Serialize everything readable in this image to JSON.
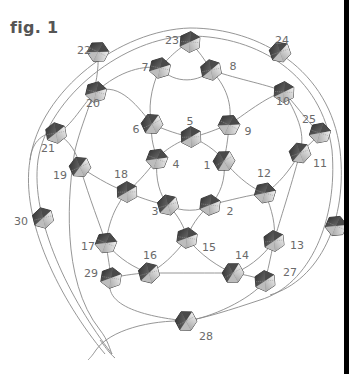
{
  "figure": {
    "title": "fig. 1",
    "colors": {
      "thread": "#8a8a8a",
      "bead_dark": "#3a3a3a",
      "bead_mid": "#7a7a7a",
      "bead_light": "#d8d8d8",
      "label": "#6a6a6a",
      "edge_bar": "#000000"
    }
  },
  "beads": [
    {
      "id": "1",
      "x": 224,
      "y": 161,
      "lx": 207,
      "ly": 165
    },
    {
      "id": "2",
      "x": 210,
      "y": 205,
      "lx": 230,
      "ly": 211
    },
    {
      "id": "3",
      "x": 168,
      "y": 205,
      "lx": 155,
      "ly": 211
    },
    {
      "id": "4",
      "x": 157,
      "y": 159,
      "lx": 176,
      "ly": 164
    },
    {
      "id": "5",
      "x": 191,
      "y": 137,
      "lx": 190,
      "ly": 121
    },
    {
      "id": "6",
      "x": 152,
      "y": 124,
      "lx": 136,
      "ly": 129
    },
    {
      "id": "7",
      "x": 160,
      "y": 68,
      "lx": 145,
      "ly": 67
    },
    {
      "id": "8",
      "x": 211,
      "y": 70,
      "lx": 233,
      "ly": 66
    },
    {
      "id": "9",
      "x": 229,
      "y": 125,
      "lx": 248,
      "ly": 131
    },
    {
      "id": "10",
      "x": 284,
      "y": 92,
      "lx": 283,
      "ly": 101
    },
    {
      "id": "11",
      "x": 300,
      "y": 153,
      "lx": 320,
      "ly": 163
    },
    {
      "id": "12",
      "x": 265,
      "y": 193,
      "lx": 264,
      "ly": 173
    },
    {
      "id": "13",
      "x": 274,
      "y": 241,
      "lx": 297,
      "ly": 245
    },
    {
      "id": "14",
      "x": 233,
      "y": 273,
      "lx": 242,
      "ly": 255
    },
    {
      "id": "15",
      "x": 187,
      "y": 238,
      "lx": 209,
      "ly": 247
    },
    {
      "id": "16",
      "x": 149,
      "y": 273,
      "lx": 150,
      "ly": 255
    },
    {
      "id": "17",
      "x": 106,
      "y": 243,
      "lx": 88,
      "ly": 246
    },
    {
      "id": "18",
      "x": 127,
      "y": 192,
      "lx": 121,
      "ly": 174
    },
    {
      "id": "19",
      "x": 80,
      "y": 167,
      "lx": 60,
      "ly": 175
    },
    {
      "id": "20",
      "x": 96,
      "y": 92,
      "lx": 93,
      "ly": 103
    },
    {
      "id": "21",
      "x": 56,
      "y": 133,
      "lx": 48,
      "ly": 148
    },
    {
      "id": "22",
      "x": 98,
      "y": 52,
      "lx": 84,
      "ly": 50
    },
    {
      "id": "23",
      "x": 190,
      "y": 42,
      "lx": 172,
      "ly": 40
    },
    {
      "id": "24",
      "x": 280,
      "y": 52,
      "lx": 282,
      "ly": 40
    },
    {
      "id": "25",
      "x": 320,
      "y": 133,
      "lx": 309,
      "ly": 119
    },
    {
      "id": "27",
      "x": 265,
      "y": 281,
      "lx": 290,
      "ly": 272
    },
    {
      "id": "28",
      "x": 186,
      "y": 321,
      "lx": 206,
      "ly": 336
    },
    {
      "id": "29",
      "x": 111,
      "y": 278,
      "lx": 91,
      "ly": 273
    },
    {
      "id": "30",
      "x": 43,
      "y": 218,
      "lx": 21,
      "ly": 221
    },
    {
      "id": "",
      "x": 336,
      "y": 226,
      "lx": 0,
      "ly": 0
    }
  ],
  "threads": [
    "M 105 354 C 60 300, 20 220, 30 160 C 40 90, 120 30, 190 28 C 260 28, 330 70, 340 150 C 348 220, 320 280, 270 295",
    "M 112 354 C 70 300, 30 220, 38 160 C 48 96, 125 37, 190 36 C 258 36, 322 75, 332 150 C 338 220, 310 285, 260 300 C 230 310, 205 318, 186 321",
    "M 30 160 C 32 140, 45 132, 56 133",
    "M 56 133 C 70 130, 85 100, 96 92",
    "M 56 133 C 70 140, 78 155, 80 167",
    "M 96 92 C 120 70, 145 65, 160 68",
    "M 96 92 C 120 80, 140 110, 152 124",
    "M 98 52 C 100 90, 85 110, 75 150 C 68 190, 60 280, 100 330 C 108 340, 110 350, 112 354",
    "M 160 68 C 175 50, 185 45, 190 42",
    "M 190 42 C 198 50, 205 60, 211 70",
    "M 160 68 C 175 85, 200 82, 211 70",
    "M 160 68 C 150 90, 148 110, 152 124",
    "M 211 70 C 230 90, 232 110, 229 125",
    "M 211 70 C 240 80, 270 85, 284 92",
    "M 152 124 C 165 130, 180 135, 191 137",
    "M 191 137 C 205 135, 218 128, 229 125",
    "M 229 125 C 250 110, 270 95, 284 92",
    "M 284 92 C 300 110, 310 125, 320 133",
    "M 284 92 C 300 120, 305 135, 300 153",
    "M 320 133 C 315 140, 305 148, 300 153",
    "M 152 124 C 150 140, 155 150, 157 159",
    "M 229 125 C 228 140, 226 150, 224 161",
    "M 191 137 C 170 145, 160 155, 157 159",
    "M 191 137 C 210 145, 220 155, 224 161",
    "M 157 159 C 155 180, 160 195, 168 205",
    "M 224 161 C 226 180, 220 195, 210 205",
    "M 168 205 C 180 212, 200 212, 210 205",
    "M 157 159 C 145 175, 135 185, 127 192",
    "M 224 161 C 240 180, 255 190, 265 193",
    "M 80 167 C 100 180, 115 188, 127 192",
    "M 127 192 C 145 200, 160 204, 168 205",
    "M 210 205 C 230 200, 250 195, 265 193",
    "M 300 153 C 290 170, 278 185, 265 193",
    "M 265 193 C 272 210, 276 225, 274 241",
    "M 300 153 C 290 190, 280 220, 274 241",
    "M 168 205 C 178 215, 185 228, 187 238",
    "M 210 205 C 198 215, 190 228, 187 238",
    "M 127 192 C 112 210, 108 228, 106 243",
    "M 80 167 C 90 200, 100 225, 106 243",
    "M 187 238 C 175 255, 160 268, 149 273",
    "M 187 238 C 200 255, 220 268, 233 273",
    "M 274 241 C 262 258, 245 270, 233 273",
    "M 274 241 C 270 260, 268 270, 265 281",
    "M 106 243 C 120 260, 135 268, 149 273",
    "M 106 243 C 108 258, 110 268, 111 278",
    "M 111 278 C 125 275, 140 273, 149 273",
    "M 149 273 C 180 273, 210 273, 233 273",
    "M 111 278 C 100 310, 160 318, 186 321",
    "M 233 273 C 248 275, 258 278, 265 281",
    "M 265 281 C 250 300, 210 318, 186 321",
    "M 186 321 C 150 320, 110 330, 96 350 C 92 356, 90 358, 88 360",
    "M 100 340 C 104 345, 108 352, 115 358"
  ]
}
